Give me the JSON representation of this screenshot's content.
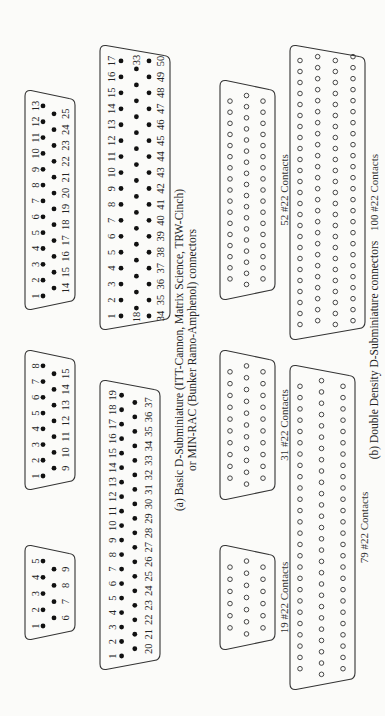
{
  "figure": {
    "orientation": "rotated-90-ccw",
    "section_a": {
      "caption_line1": "(a) Basic D-Subminiature (ITT-Cannon, Matrix Science, TRW-Cinch)",
      "caption_line2": "or MIN-RAC (Bunker Ramo-Amphenol) connectors",
      "connectors": [
        {
          "name": "DE-9",
          "pins": 9,
          "rows": [
            [
              1,
              2,
              3,
              4,
              5
            ],
            [
              6,
              7,
              8,
              9
            ]
          ]
        },
        {
          "name": "DA-15",
          "pins": 15,
          "rows": [
            [
              1,
              2,
              3,
              4,
              5,
              6,
              7,
              8
            ],
            [
              9,
              10,
              11,
              12,
              13,
              14,
              15
            ]
          ]
        },
        {
          "name": "DB-25",
          "pins": 25,
          "rows": [
            [
              1,
              2,
              3,
              4,
              5,
              6,
              7,
              8,
              9,
              10,
              11,
              12,
              13
            ],
            [
              14,
              15,
              16,
              17,
              18,
              19,
              20,
              21,
              22,
              23,
              24,
              25
            ]
          ]
        },
        {
          "name": "DC-37",
          "pins": 37,
          "rows": [
            [
              1,
              2,
              3,
              4,
              5,
              6,
              7,
              8,
              9,
              10,
              11,
              12,
              13,
              14,
              15,
              16,
              17,
              18,
              19
            ],
            [
              20,
              21,
              22,
              23,
              24,
              25,
              26,
              27,
              28,
              29,
              30,
              31,
              32,
              33,
              34,
              35,
              36,
              37
            ]
          ]
        },
        {
          "name": "DD-50",
          "pins": 50,
          "rows": [
            [
              1,
              2,
              3,
              4,
              5,
              6,
              7,
              8,
              9,
              10,
              11,
              12,
              13,
              14,
              15,
              16,
              17
            ],
            [
              18,
              19,
              20,
              21,
              22,
              23,
              24,
              25,
              26,
              27,
              28,
              29,
              30,
              31,
              32,
              33
            ],
            [
              34,
              35,
              36,
              37,
              38,
              39,
              40,
              41,
              42,
              43,
              44,
              45,
              46,
              47,
              48,
              49,
              50
            ]
          ]
        }
      ]
    },
    "section_b": {
      "caption": "(b) Double Density D-Subminiature connectors",
      "connectors": [
        {
          "label": "19 #22 Contacts",
          "contacts": 19,
          "rows": [
            6,
            7,
            6
          ]
        },
        {
          "label": "31 #22 Contacts",
          "contacts": 31,
          "rows": [
            10,
            11,
            10
          ]
        },
        {
          "label": "52 #22 Contacts",
          "contacts": 52,
          "rows": [
            17,
            18,
            17
          ]
        },
        {
          "label": "79 #22 Contacts",
          "contacts": 79,
          "rows": [
            26,
            27,
            26
          ]
        },
        {
          "label": "100 #22 Contacts",
          "contacts": 100,
          "rows": [
            25,
            25,
            25,
            25
          ]
        }
      ]
    }
  }
}
